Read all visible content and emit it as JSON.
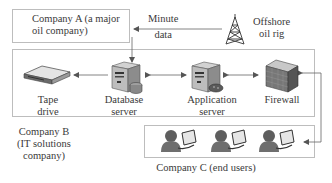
{
  "diagram": {
    "company_a": {
      "label_line1": "Company A (a major",
      "label_line2": "oil company)"
    },
    "minute_data": {
      "line1": "Minute",
      "line2": "data"
    },
    "oil_rig": {
      "line1": "Offshore",
      "line2": "oil rig",
      "icon": "radio-tower-icon"
    },
    "company_b": {
      "label_line1": "Company B",
      "label_line2": "(IT solutions",
      "label_line3": "company)",
      "nodes": [
        {
          "id": "tape",
          "line1": "Tape",
          "line2": "drive",
          "icon": "tape-drive-icon"
        },
        {
          "id": "db",
          "line1": "Database",
          "line2": "server",
          "icon": "database-server-icon"
        },
        {
          "id": "app",
          "line1": "Application",
          "line2": "server",
          "icon": "application-server-icon"
        },
        {
          "id": "fw",
          "line1": "Firewall",
          "line2": "",
          "icon": "firewall-icon"
        }
      ]
    },
    "company_c": {
      "label": "Company C (end users)",
      "user_count": 3,
      "icon": "user-workstation-icon"
    },
    "colors": {
      "border": "#bdbdbd",
      "arrow": "#555555",
      "icon_dark": "#5a5a5a",
      "icon_light": "#d8d8d8"
    }
  }
}
